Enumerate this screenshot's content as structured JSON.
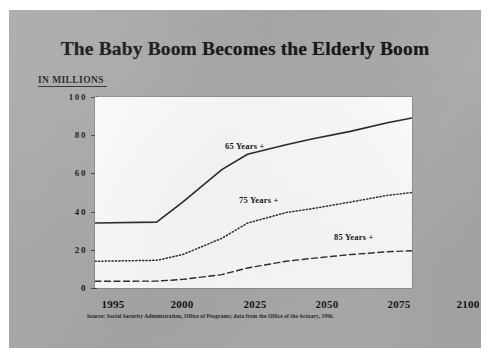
{
  "slide": {
    "background_color": "#a8a8a8",
    "title": "The Baby Boom Becomes the Elderly Boom",
    "units_label": "IN MILLIONS",
    "source_note": "Source:  Social Security Administration, Office of Programs;  data from the Office of the Actuary, 1996."
  },
  "chart_data": {
    "type": "line",
    "title": "The Baby Boom Becomes the Elderly Boom",
    "xlabel": "",
    "ylabel": "IN MILLIONS",
    "xlim": [
      1995,
      2100
    ],
    "ylim": [
      0,
      100
    ],
    "grid": false,
    "legend": "inline-annotations",
    "x_tick_labels": [
      "1995",
      "2000",
      "2025",
      "2050",
      "2075",
      "2100"
    ],
    "x_tick_values": [
      1995,
      2000,
      2025,
      2050,
      2075,
      2100
    ],
    "y_tick_labels": [
      "0",
      "20",
      "40",
      "60",
      "80",
      "100"
    ],
    "y_tick_values": [
      0,
      20,
      40,
      60,
      80,
      100
    ],
    "x": [
      1995,
      2000,
      2010,
      2025,
      2035,
      2050,
      2060,
      2075,
      2090,
      2100
    ],
    "series": [
      {
        "name": "65 Years +",
        "line_style": "solid",
        "color": "#262626",
        "values": [
          34,
          34.5,
          45,
          62,
          70,
          75,
          78,
          82,
          86.5,
          89
        ]
      },
      {
        "name": "75 Years +",
        "line_style": "dotted",
        "color": "#2b2b2b",
        "values": [
          14,
          14.5,
          17.5,
          26,
          34,
          39.5,
          41.5,
          45,
          48.5,
          50
        ]
      },
      {
        "name": "85 Years +",
        "line_style": "dashed",
        "color": "#2b2b2b",
        "values": [
          3.5,
          3.6,
          4.5,
          7,
          10.5,
          14,
          15.5,
          17.5,
          19,
          19.5
        ]
      }
    ],
    "annotations": [
      {
        "text": "65 Years +",
        "series": "65 Years +"
      },
      {
        "text": "75 Years +",
        "series": "75 Years +"
      },
      {
        "text": "85 Years +",
        "series": "85 Years +"
      }
    ]
  }
}
